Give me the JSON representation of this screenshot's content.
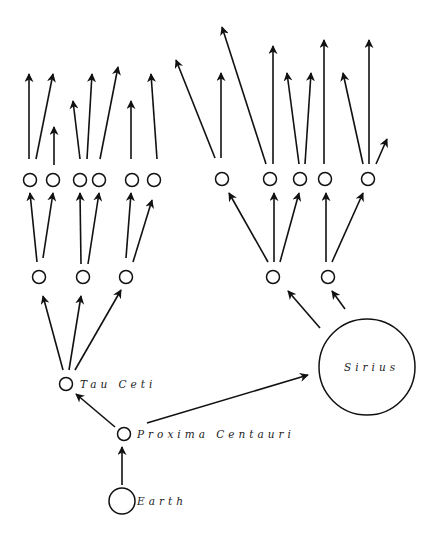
{
  "diagram": {
    "type": "tree",
    "colors": {
      "stroke": "#111111",
      "background": "#ffffff"
    },
    "nodes": [
      {
        "id": "earth",
        "label": "Earth",
        "x": 122,
        "y": 501,
        "r": 13,
        "label_x": 137,
        "label_y": 505
      },
      {
        "id": "proxima",
        "label": "Proxima Centauri",
        "x": 124,
        "y": 434,
        "r": 6.5,
        "label_x": 137,
        "label_y": 438
      },
      {
        "id": "tau",
        "label": "Tau Ceti",
        "x": 66,
        "y": 384,
        "r": 6.5,
        "label_x": 80,
        "label_y": 388
      },
      {
        "id": "sirius",
        "label": "Sirius",
        "x": 367,
        "y": 367,
        "r": 48,
        "label_x": 344,
        "label_y": 371
      },
      {
        "id": "t1",
        "label": "",
        "x": 39,
        "y": 277,
        "r": 6.5
      },
      {
        "id": "t2",
        "label": "",
        "x": 83,
        "y": 277,
        "r": 6.5
      },
      {
        "id": "t3",
        "label": "",
        "x": 126,
        "y": 277,
        "r": 6.5
      },
      {
        "id": "s1",
        "label": "",
        "x": 273,
        "y": 277,
        "r": 6.5
      },
      {
        "id": "s2",
        "label": "",
        "x": 328,
        "y": 277,
        "r": 6.5
      },
      {
        "id": "l1",
        "label": "",
        "x": 30,
        "y": 180,
        "r": 6.5
      },
      {
        "id": "l2",
        "label": "",
        "x": 53,
        "y": 180,
        "r": 6.5
      },
      {
        "id": "l3",
        "label": "",
        "x": 80,
        "y": 180,
        "r": 6.5
      },
      {
        "id": "l4",
        "label": "",
        "x": 99,
        "y": 180,
        "r": 6.5
      },
      {
        "id": "l5",
        "label": "",
        "x": 132,
        "y": 180,
        "r": 6.5
      },
      {
        "id": "l6",
        "label": "",
        "x": 154,
        "y": 180,
        "r": 6.5
      },
      {
        "id": "r1",
        "label": "",
        "x": 222,
        "y": 179,
        "r": 6.5
      },
      {
        "id": "r2",
        "label": "",
        "x": 270,
        "y": 179,
        "r": 6.5
      },
      {
        "id": "r3",
        "label": "",
        "x": 300,
        "y": 179,
        "r": 6.5
      },
      {
        "id": "r4",
        "label": "",
        "x": 325,
        "y": 179,
        "r": 6.5
      },
      {
        "id": "r5",
        "label": "",
        "x": 368,
        "y": 179,
        "r": 6.5
      }
    ],
    "edges": [
      {
        "from": "earth",
        "to": "proxima",
        "x1": 122,
        "y1": 485,
        "x2": 122,
        "y2": 447
      },
      {
        "from": "proxima",
        "to": "tau",
        "x1": 115,
        "y1": 427,
        "x2": 76,
        "y2": 394
      },
      {
        "from": "proxima",
        "to": "sirius",
        "x1": 147,
        "y1": 423,
        "x2": 308,
        "y2": 375
      },
      {
        "from": "tau",
        "to": "t1",
        "x1": 63,
        "y1": 370,
        "x2": 43,
        "y2": 296
      },
      {
        "from": "tau",
        "to": "t2",
        "x1": 69,
        "y1": 370,
        "x2": 81,
        "y2": 296
      },
      {
        "from": "tau",
        "to": "t3",
        "x1": 75,
        "y1": 370,
        "x2": 121,
        "y2": 290
      },
      {
        "from": "sirius",
        "to": "s1",
        "x1": 320,
        "y1": 328,
        "x2": 288,
        "y2": 291
      },
      {
        "from": "sirius",
        "to": "s2",
        "x1": 345,
        "y1": 309,
        "x2": 332,
        "y2": 291
      },
      {
        "from": "t1",
        "to": "l1",
        "x1": 37,
        "y1": 262,
        "x2": 30,
        "y2": 193
      },
      {
        "from": "t1",
        "to": "l2",
        "x1": 43,
        "y1": 258,
        "x2": 53,
        "y2": 193
      },
      {
        "from": "t2",
        "to": "l3",
        "x1": 81,
        "y1": 264,
        "x2": 80,
        "y2": 193
      },
      {
        "from": "t2",
        "to": "l4",
        "x1": 88,
        "y1": 264,
        "x2": 99,
        "y2": 193
      },
      {
        "from": "t3",
        "to": "l5",
        "x1": 126,
        "y1": 258,
        "x2": 131,
        "y2": 193
      },
      {
        "from": "t3",
        "to": "l6",
        "x1": 133,
        "y1": 262,
        "x2": 152,
        "y2": 200
      },
      {
        "from": "s1",
        "to": "r1",
        "x1": 268,
        "y1": 262,
        "x2": 229,
        "y2": 193
      },
      {
        "from": "s1",
        "to": "r2",
        "x1": 274,
        "y1": 262,
        "x2": 274,
        "y2": 193
      },
      {
        "from": "s1",
        "to": "r3",
        "x1": 280,
        "y1": 262,
        "x2": 299,
        "y2": 193
      },
      {
        "from": "s2",
        "to": "r4",
        "x1": 326,
        "y1": 262,
        "x2": 326,
        "y2": 193
      },
      {
        "from": "s2",
        "to": "r5",
        "x1": 332,
        "y1": 262,
        "x2": 363,
        "y2": 193
      },
      {
        "from": "l1",
        "to": "out",
        "x1": 29,
        "y1": 159,
        "x2": 29,
        "y2": 74
      },
      {
        "from": "l1",
        "to": "out",
        "x1": 36,
        "y1": 159,
        "x2": 53,
        "y2": 74
      },
      {
        "from": "l2",
        "to": "out",
        "x1": 54,
        "y1": 165,
        "x2": 54,
        "y2": 127
      },
      {
        "from": "l3",
        "to": "out",
        "x1": 80,
        "y1": 159,
        "x2": 73,
        "y2": 101
      },
      {
        "from": "l3",
        "to": "out",
        "x1": 87,
        "y1": 159,
        "x2": 92,
        "y2": 74
      },
      {
        "from": "l4",
        "to": "out",
        "x1": 100,
        "y1": 159,
        "x2": 118,
        "y2": 67
      },
      {
        "from": "l5",
        "to": "out",
        "x1": 131,
        "y1": 159,
        "x2": 131,
        "y2": 101
      },
      {
        "from": "l6",
        "to": "out",
        "x1": 157,
        "y1": 159,
        "x2": 151,
        "y2": 74
      },
      {
        "from": "r1",
        "to": "out",
        "x1": 215,
        "y1": 158,
        "x2": 176,
        "y2": 60
      },
      {
        "from": "r1",
        "to": "out",
        "x1": 221,
        "y1": 158,
        "x2": 221,
        "y2": 73
      },
      {
        "from": "r2",
        "to": "out",
        "x1": 266,
        "y1": 164,
        "x2": 222,
        "y2": 27
      },
      {
        "from": "r2",
        "to": "out",
        "x1": 273,
        "y1": 164,
        "x2": 273,
        "y2": 46
      },
      {
        "from": "r3",
        "to": "out",
        "x1": 299,
        "y1": 164,
        "x2": 287,
        "y2": 73
      },
      {
        "from": "r3",
        "to": "out",
        "x1": 305,
        "y1": 164,
        "x2": 311,
        "y2": 73
      },
      {
        "from": "r4",
        "to": "out",
        "x1": 324,
        "y1": 164,
        "x2": 324,
        "y2": 40
      },
      {
        "from": "r5",
        "to": "out",
        "x1": 363,
        "y1": 164,
        "x2": 343,
        "y2": 73
      },
      {
        "from": "r5",
        "to": "out",
        "x1": 369,
        "y1": 164,
        "x2": 369,
        "y2": 40
      },
      {
        "from": "r5",
        "to": "out",
        "x1": 376,
        "y1": 164,
        "x2": 387,
        "y2": 139
      }
    ]
  }
}
